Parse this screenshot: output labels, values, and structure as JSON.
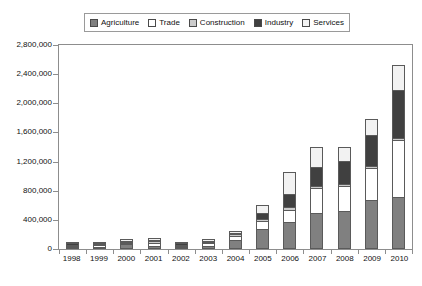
{
  "legend": {
    "position": "top-center",
    "entries": [
      {
        "label": "Agriculture",
        "color": "#808080"
      },
      {
        "label": "Trade",
        "color": "#ffffff"
      },
      {
        "label": "Construction",
        "color": "#cccccc"
      },
      {
        "label": "Industry",
        "color": "#404040"
      },
      {
        "label": "Services",
        "color": "#f2f2f2"
      }
    ]
  },
  "axes": {
    "y_ticks": [
      "0",
      "400,000",
      "800,000",
      "1,200,000",
      "1,600,000",
      "2,000,000",
      "2,400,000",
      "2,800,000"
    ],
    "x_ticks": [
      "1998",
      "1999",
      "2000",
      "2001",
      "2002",
      "2003",
      "2004",
      "2005",
      "2006",
      "2007",
      "2008",
      "2009",
      "2010"
    ]
  },
  "chart_data": {
    "type": "bar",
    "stacked": true,
    "title": "",
    "subtitle": "",
    "xlabel": "",
    "ylabel": "",
    "ylim": [
      0,
      2800000
    ],
    "ytick_step": 400000,
    "grid": false,
    "legend_position": "top-center",
    "categories": [
      "1998",
      "1999",
      "2000",
      "2001",
      "2002",
      "2003",
      "2004",
      "2005",
      "2006",
      "2007",
      "2008",
      "2009",
      "2010"
    ],
    "series": [
      {
        "name": "Agriculture",
        "color": "#808080",
        "values": [
          8000,
          22000,
          66000,
          46000,
          22000,
          48000,
          130000,
          280000,
          375000,
          495000,
          520000,
          670000,
          710000
        ]
      },
      {
        "name": "Trade",
        "color": "#ffffff",
        "values": [
          8000,
          22000,
          16000,
          40000,
          16000,
          30000,
          45000,
          105000,
          160000,
          345000,
          350000,
          440000,
          780000
        ]
      },
      {
        "name": "Construction",
        "color": "#cccccc",
        "values": [
          4000,
          8000,
          8000,
          28000,
          6000,
          22000,
          25000,
          30000,
          35000,
          30000,
          25000,
          30000,
          30000
        ]
      },
      {
        "name": "Industry",
        "color": "#404040",
        "values": [
          4000,
          8000,
          8000,
          12000,
          6000,
          14000,
          16000,
          80000,
          190000,
          255000,
          310000,
          420000,
          660000
        ]
      },
      {
        "name": "Services",
        "color": "#f2f2f2",
        "values": [
          2000,
          8000,
          6000,
          28000,
          4000,
          8000,
          25000,
          110000,
          300000,
          280000,
          195000,
          225000,
          350000
        ]
      }
    ],
    "totals": [
      26000,
      68000,
      104000,
      154000,
      54000,
      122000,
      241000,
      605000,
      1060000,
      1405000,
      1400000,
      1785000,
      2530000
    ]
  }
}
